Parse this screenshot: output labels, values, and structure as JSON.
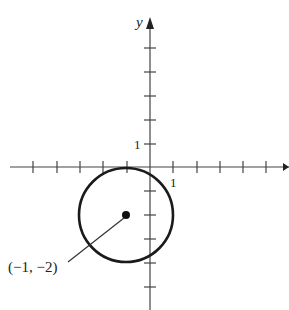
{
  "figure": {
    "type": "coordinate-plane-circle",
    "axes": {
      "x_label": "",
      "y_label": "y",
      "x_tick_label": "1",
      "y_tick_label": "1",
      "x_ticks": [
        -5,
        -4,
        -3,
        -2,
        -1,
        1,
        2,
        3,
        4,
        5
      ],
      "y_ticks": [
        -5,
        -4,
        -3,
        -2,
        -1,
        1,
        2,
        3,
        4,
        5
      ]
    },
    "circle": {
      "center": [
        -1,
        -2
      ],
      "radius": 2
    },
    "center_point_label": "(−1, −2)",
    "colors": {
      "stroke": "#1a1a1a",
      "axis": "#444444",
      "background": "#ffffff"
    }
  }
}
